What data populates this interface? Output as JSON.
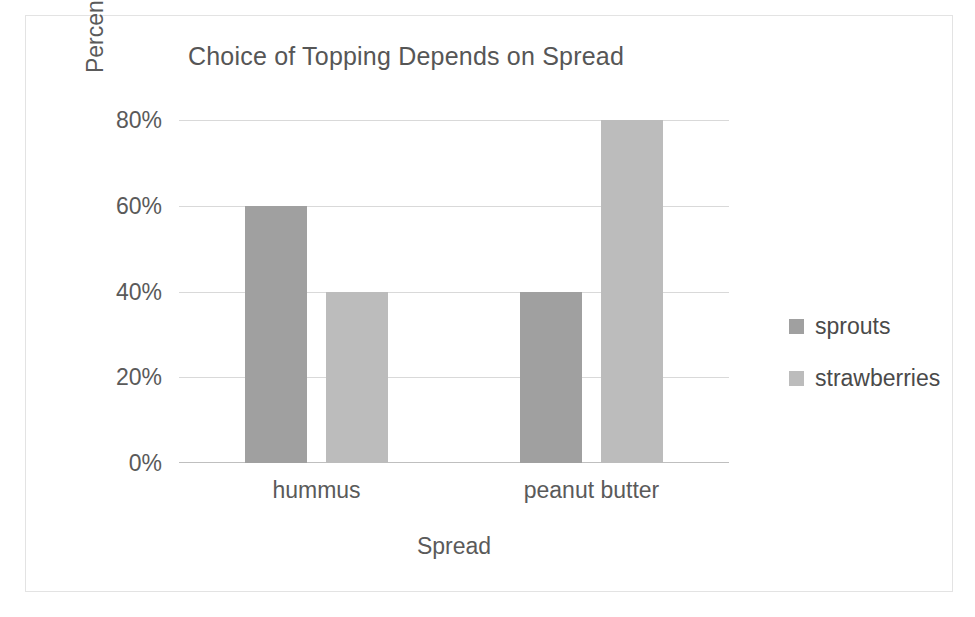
{
  "chart_data": {
    "type": "bar",
    "title": "Choice of Topping Depends on Spread",
    "xlabel": "Spread",
    "ylabel": "Percent of Students",
    "categories": [
      "hummus",
      "peanut butter"
    ],
    "series": [
      {
        "name": "sprouts",
        "values": [
          60,
          40
        ],
        "color": "#a0a0a0"
      },
      {
        "name": "strawberries",
        "values": [
          40,
          80
        ],
        "color": "#bcbcbc"
      }
    ],
    "ylim": [
      0,
      80
    ],
    "yticks": [
      0,
      20,
      40,
      60,
      80
    ],
    "ytick_labels": [
      "0%",
      "20%",
      "40%",
      "60%",
      "80%"
    ],
    "grid": true,
    "legend_position": "right",
    "value_suffix": "%"
  }
}
